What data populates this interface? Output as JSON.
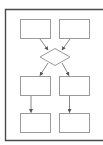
{
  "diagram": {
    "type": "flowchart",
    "colors": {
      "background": "#ffffff",
      "frame": "#4a4a4a",
      "node_stroke": "#9a9a9a",
      "node_fill": "#ffffff",
      "edge": "#6a6a6a"
    },
    "frame": {
      "x": 5,
      "y": 9,
      "right": 103,
      "bottom": 141
    },
    "nodes": [
      {
        "id": "box-top-left",
        "shape": "rect",
        "x": 20,
        "y": 19,
        "w": 30,
        "h": 19,
        "label": ""
      },
      {
        "id": "box-top-right",
        "shape": "rect",
        "x": 59,
        "y": 19,
        "w": 30,
        "h": 19,
        "label": ""
      },
      {
        "id": "decision",
        "shape": "diamond",
        "cx": 55,
        "cy": 57,
        "w": 30,
        "h": 17,
        "label": ""
      },
      {
        "id": "box-mid-left",
        "shape": "rect",
        "x": 20,
        "y": 76,
        "w": 30,
        "h": 19,
        "label": ""
      },
      {
        "id": "box-mid-right",
        "shape": "rect",
        "x": 59,
        "y": 76,
        "w": 30,
        "h": 19,
        "label": ""
      },
      {
        "id": "box-bottom-left",
        "shape": "rect",
        "x": 20,
        "y": 113,
        "w": 30,
        "h": 19,
        "label": ""
      },
      {
        "id": "box-bottom-right",
        "shape": "rect",
        "x": 59,
        "y": 113,
        "w": 30,
        "h": 19,
        "label": ""
      }
    ],
    "edges": [
      {
        "from": "box-top-left",
        "to": "decision"
      },
      {
        "from": "box-top-right",
        "to": "decision"
      },
      {
        "from": "decision",
        "to": "box-mid-left"
      },
      {
        "from": "decision",
        "to": "box-mid-right"
      },
      {
        "from": "box-mid-left",
        "to": "box-bottom-left"
      },
      {
        "from": "box-mid-right",
        "to": "box-bottom-right"
      }
    ]
  }
}
